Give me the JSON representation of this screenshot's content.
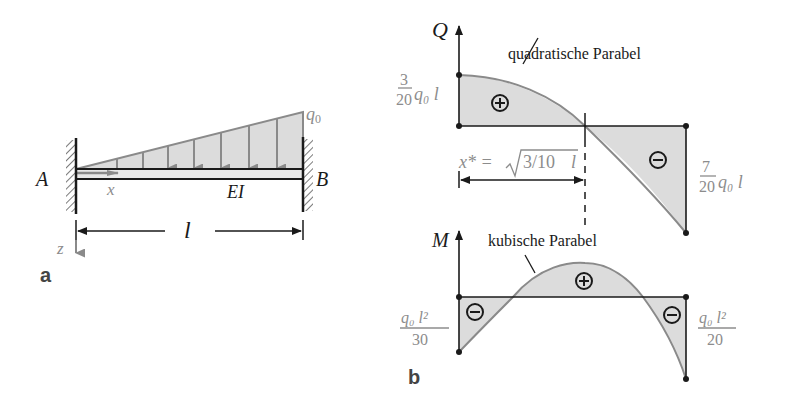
{
  "colors": {
    "fill": "#dcdcdc",
    "load_line": "#8a8a8a",
    "dark": "#1a1a1a",
    "gray_text": "#8c8c8c"
  },
  "panel_a": {
    "label": "a",
    "support_left": "A",
    "support_right": "B",
    "load_label": "q",
    "load_sub": "0",
    "x_axis": "x",
    "z_axis": "z",
    "stiffness": "EI",
    "length": "l"
  },
  "panel_b": {
    "label": "b",
    "shear": {
      "axis": "Q",
      "curve_note": "quadratische Parabel",
      "left_value_num": "3",
      "left_value_den": "20",
      "left_value_tail": "q₀ l",
      "right_value_num": "7",
      "right_value_den": "20",
      "right_value_tail": "q₀ l",
      "zero_label_lhs": "x* = ",
      "zero_label_rad": "3/10",
      "zero_label_rhs": "l",
      "sign_pos": "+",
      "sign_neg": "−"
    },
    "moment": {
      "axis": "M",
      "curve_note": "kubische Parabel",
      "left_value_num": "q₀ l²",
      "left_value_den": "30",
      "right_value_num": "q₀ l²",
      "right_value_den": "20",
      "sign_pos": "+",
      "sign_neg_left": "−",
      "sign_neg_right": "−"
    }
  }
}
